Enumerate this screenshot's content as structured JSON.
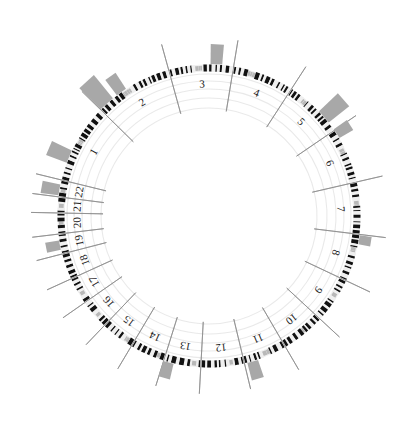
{
  "figure": {
    "type": "circular-genome-ideogram",
    "title": "",
    "width": 419,
    "height": 435,
    "background_color": "#ffffff"
  },
  "geometry": {
    "center_x": 209,
    "center_y": 216,
    "ideogram_radius": 148,
    "ideogram_thickness": 7,
    "gridline_radii": [
      108,
      118,
      127,
      135,
      142
    ],
    "tick_inner_radius": 140,
    "tick_outer_radius": 178,
    "label_radius": 131,
    "start_angle_deg": -76,
    "total_sweep_deg": 360
  },
  "colors": {
    "band_dark": "#111111",
    "band_light": "#efefef",
    "band_mid": "#d6d6d6",
    "centromere": "#b8b8b8",
    "histogram_bar": "#a8a8a8",
    "gridline": "#e8e8e8",
    "tick_line": "#8c8c8c",
    "label_text": "#1a1a1a",
    "outline": "#cfcfcf"
  },
  "chart_data": {
    "type": "bar",
    "xlabel": "Chromosome",
    "ylabel": "Track value",
    "grid": true,
    "legend_position": "none",
    "categories": [
      "1",
      "2",
      "3",
      "4",
      "5",
      "6",
      "7",
      "8",
      "9",
      "10",
      "11",
      "12",
      "13",
      "14",
      "15",
      "16",
      "17",
      "18",
      "19",
      "20",
      "21",
      "22"
    ],
    "series": [
      {
        "name": "Histogram track",
        "values": [
          22,
          30,
          20,
          0,
          26,
          16,
          0,
          12,
          0,
          0,
          18,
          0,
          16,
          0,
          0,
          0,
          0,
          0,
          14,
          0,
          0,
          18
        ]
      }
    ],
    "ylim": [
      0,
      32
    ]
  },
  "chromosomes": [
    {
      "id": "chr1",
      "label": "1",
      "span_deg": 25.5,
      "label_angle_deg": 0,
      "bands": 30,
      "centromere_frac": 0.5
    },
    {
      "id": "chr2",
      "label": "2",
      "span_deg": 25.0,
      "label_angle_deg": 0,
      "bands": 28,
      "centromere_frac": 0.38
    },
    {
      "id": "chr3",
      "label": "3",
      "span_deg": 20.5,
      "label_angle_deg": 0,
      "bands": 24,
      "centromere_frac": 0.46
    },
    {
      "id": "chr4",
      "label": "4",
      "span_deg": 19.5,
      "label_angle_deg": 0,
      "bands": 22,
      "centromere_frac": 0.28
    },
    {
      "id": "chr5",
      "label": "5",
      "span_deg": 18.7,
      "label_angle_deg": 0,
      "bands": 22,
      "centromere_frac": 0.27
    },
    {
      "id": "chr6",
      "label": "6",
      "span_deg": 17.6,
      "label_angle_deg": 0,
      "bands": 20,
      "centromere_frac": 0.36
    },
    {
      "id": "chr7",
      "label": "7",
      "span_deg": 16.4,
      "label_angle_deg": 0,
      "bands": 19,
      "centromere_frac": 0.38
    },
    {
      "id": "chr8",
      "label": "8",
      "span_deg": 15.0,
      "label_angle_deg": 0,
      "bands": 17,
      "centromere_frac": 0.31
    },
    {
      "id": "chr9",
      "label": "9",
      "span_deg": 14.4,
      "label_angle_deg": 0,
      "bands": 16,
      "centromere_frac": 0.36
    },
    {
      "id": "chr10",
      "label": "10",
      "span_deg": 13.8,
      "label_angle_deg": 0,
      "bands": 15,
      "centromere_frac": 0.42
    },
    {
      "id": "chr11",
      "label": "11",
      "span_deg": 13.7,
      "label_angle_deg": 0,
      "bands": 15,
      "centromere_frac": 0.4
    },
    {
      "id": "chr12",
      "label": "12",
      "span_deg": 13.6,
      "label_angle_deg": 0,
      "bands": 15,
      "centromere_frac": 0.27
    },
    {
      "id": "chr13",
      "label": "13",
      "span_deg": 11.6,
      "label_angle_deg": 0,
      "bands": 12,
      "centromere_frac": 0.16
    },
    {
      "id": "chr14",
      "label": "14",
      "span_deg": 10.9,
      "label_angle_deg": 0,
      "bands": 11,
      "centromere_frac": 0.16
    },
    {
      "id": "chr15",
      "label": "15",
      "span_deg": 10.4,
      "label_angle_deg": 0,
      "bands": 11,
      "centromere_frac": 0.17
    },
    {
      "id": "chr16",
      "label": "16",
      "span_deg": 9.2,
      "label_angle_deg": 0,
      "bands": 10,
      "centromere_frac": 0.4
    },
    {
      "id": "chr17",
      "label": "17",
      "span_deg": 8.3,
      "label_angle_deg": 0,
      "bands": 9,
      "centromere_frac": 0.3
    },
    {
      "id": "chr18",
      "label": "18",
      "span_deg": 8.0,
      "label_angle_deg": 0,
      "bands": 9,
      "centromere_frac": 0.22
    },
    {
      "id": "chr19",
      "label": "19",
      "span_deg": 6.0,
      "label_angle_deg": 0,
      "bands": 7,
      "centromere_frac": 0.48
    },
    {
      "id": "chr20",
      "label": "20",
      "span_deg": 6.3,
      "label_angle_deg": 0,
      "bands": 7,
      "centromere_frac": 0.44
    },
    {
      "id": "chr21",
      "label": "21",
      "span_deg": 4.7,
      "label_angle_deg": 0,
      "bands": 5,
      "centromere_frac": 0.27
    },
    {
      "id": "chr22",
      "label": "22",
      "span_deg": 5.0,
      "label_angle_deg": 0,
      "bands": 5,
      "centromere_frac": 0.28
    }
  ],
  "histogram_bars": [
    {
      "chromosome": "1",
      "position_frac": 0.3,
      "height": 22,
      "width_deg": 5.0
    },
    {
      "chromosome": "2",
      "position_frac": 0.1,
      "height": 30,
      "width_deg": 6.2
    },
    {
      "chromosome": "2",
      "position_frac": 0.34,
      "height": 19,
      "width_deg": 4.2
    },
    {
      "chromosome": "3",
      "position_frac": 0.74,
      "height": 20,
      "width_deg": 4.4
    },
    {
      "chromosome": "5",
      "position_frac": 0.72,
      "height": 26,
      "width_deg": 5.6
    },
    {
      "chromosome": "6",
      "position_frac": 0.06,
      "height": 16,
      "width_deg": 4.0
    },
    {
      "chromosome": "8",
      "position_frac": 0.1,
      "height": 12,
      "width_deg": 3.4
    },
    {
      "chromosome": "11",
      "position_frac": 0.82,
      "height": 18,
      "width_deg": 4.2
    },
    {
      "chromosome": "13",
      "position_frac": 0.88,
      "height": 16,
      "width_deg": 4.0
    },
    {
      "chromosome": "19",
      "position_frac": 0.45,
      "height": 14,
      "width_deg": 3.6
    },
    {
      "chromosome": "22",
      "position_frac": 0.4,
      "height": 18,
      "width_deg": 4.2
    }
  ]
}
